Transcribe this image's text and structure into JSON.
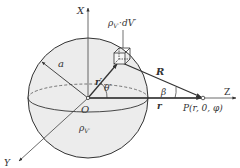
{
  "diagram": {
    "axes": {
      "x_label": "X",
      "y_label": "Y",
      "z_label": "Z"
    },
    "origin_label": "O",
    "radius_label": "a",
    "charge_element": {
      "rho_symbol": "ρ",
      "rho_subscript": "V′",
      "dot": "·",
      "dV_label": "dV′"
    },
    "volume_density": {
      "rho_symbol": "ρ",
      "rho_subscript": "V′"
    },
    "source_vector_label": "r′",
    "angle_theta_label": "θ′",
    "distance_vector_label": "R",
    "angle_beta_label": "β",
    "field_distance_label": "r",
    "field_point_label": "P(r, 0, φ)",
    "colors": {
      "line": "#333333",
      "sphere_fill": "#ececec",
      "axis": "#555555"
    }
  }
}
